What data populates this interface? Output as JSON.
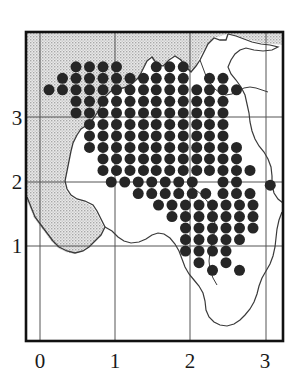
{
  "figure": {
    "type": "distribution-dot-map",
    "title": "",
    "background_color": "#ffffff"
  },
  "axes": {
    "x_ticks": [
      "0",
      "1",
      "2",
      "3"
    ],
    "y_ticks": [
      "1",
      "2",
      "3"
    ],
    "x_range": [
      -0.19,
      3.17
    ],
    "y_range": [
      0.52,
      4.29
    ],
    "grid": "on",
    "grid_color": "#555555",
    "frame_color": "#1a1a1a",
    "xlabel": "",
    "ylabel": ""
  },
  "legend": {
    "entries": [
      {
        "symbol": "filled-circle",
        "label": "",
        "color": "#262626"
      },
      {
        "symbol": "stipple-fill",
        "label": "",
        "color": "#c8c8c8"
      }
    ],
    "position": "none"
  },
  "chart_data": {
    "type": "scatter",
    "title": "",
    "xlabel": "",
    "ylabel": "",
    "xlim": [
      -0.19,
      3.17
    ],
    "ylim": [
      0.52,
      4.29
    ],
    "grid": true,
    "legend_position": "none",
    "marker": "filled-circle",
    "marker_color": "#262626",
    "marker_size_px": 11,
    "grid_spacing": 0.175,
    "x_tick_values": [
      0,
      1,
      2,
      3
    ],
    "y_tick_values": [
      1,
      2,
      3
    ],
    "points": [
      [
        0.48,
        3.8
      ],
      [
        0.66,
        3.8
      ],
      [
        0.84,
        3.8
      ],
      [
        1.02,
        3.8
      ],
      [
        1.55,
        3.8
      ],
      [
        1.73,
        3.8
      ],
      [
        1.91,
        3.8
      ],
      [
        0.3,
        3.62
      ],
      [
        0.48,
        3.62
      ],
      [
        0.66,
        3.62
      ],
      [
        0.84,
        3.62
      ],
      [
        1.02,
        3.62
      ],
      [
        1.2,
        3.62
      ],
      [
        1.38,
        3.62
      ],
      [
        1.55,
        3.62
      ],
      [
        1.73,
        3.62
      ],
      [
        1.91,
        3.62
      ],
      [
        2.26,
        3.62
      ],
      [
        2.44,
        3.62
      ],
      [
        0.12,
        3.44
      ],
      [
        0.3,
        3.44
      ],
      [
        0.48,
        3.44
      ],
      [
        0.66,
        3.44
      ],
      [
        0.84,
        3.44
      ],
      [
        1.02,
        3.44
      ],
      [
        1.2,
        3.44
      ],
      [
        1.38,
        3.44
      ],
      [
        1.55,
        3.44
      ],
      [
        1.73,
        3.44
      ],
      [
        1.91,
        3.44
      ],
      [
        2.09,
        3.44
      ],
      [
        2.26,
        3.44
      ],
      [
        2.44,
        3.44
      ],
      [
        2.62,
        3.44
      ],
      [
        0.48,
        3.26
      ],
      [
        0.66,
        3.26
      ],
      [
        0.84,
        3.26
      ],
      [
        1.02,
        3.26
      ],
      [
        1.2,
        3.26
      ],
      [
        1.38,
        3.26
      ],
      [
        1.55,
        3.26
      ],
      [
        1.73,
        3.26
      ],
      [
        1.91,
        3.26
      ],
      [
        2.09,
        3.26
      ],
      [
        2.26,
        3.26
      ],
      [
        2.44,
        3.26
      ],
      [
        0.48,
        3.08
      ],
      [
        0.66,
        3.08
      ],
      [
        0.84,
        3.08
      ],
      [
        1.02,
        3.08
      ],
      [
        1.2,
        3.08
      ],
      [
        1.38,
        3.08
      ],
      [
        1.55,
        3.08
      ],
      [
        1.73,
        3.08
      ],
      [
        1.91,
        3.08
      ],
      [
        2.09,
        3.08
      ],
      [
        2.26,
        3.08
      ],
      [
        2.44,
        3.08
      ],
      [
        0.66,
        2.9
      ],
      [
        0.84,
        2.9
      ],
      [
        1.02,
        2.9
      ],
      [
        1.2,
        2.9
      ],
      [
        1.38,
        2.9
      ],
      [
        1.55,
        2.9
      ],
      [
        1.73,
        2.9
      ],
      [
        1.91,
        2.9
      ],
      [
        2.09,
        2.9
      ],
      [
        2.26,
        2.9
      ],
      [
        2.44,
        2.9
      ],
      [
        0.66,
        2.72
      ],
      [
        0.84,
        2.72
      ],
      [
        1.02,
        2.72
      ],
      [
        1.2,
        2.72
      ],
      [
        1.38,
        2.72
      ],
      [
        1.55,
        2.72
      ],
      [
        1.73,
        2.72
      ],
      [
        1.91,
        2.72
      ],
      [
        2.09,
        2.72
      ],
      [
        2.26,
        2.72
      ],
      [
        2.44,
        2.72
      ],
      [
        0.66,
        2.54
      ],
      [
        0.84,
        2.54
      ],
      [
        1.02,
        2.54
      ],
      [
        1.2,
        2.54
      ],
      [
        1.38,
        2.54
      ],
      [
        1.55,
        2.54
      ],
      [
        1.73,
        2.54
      ],
      [
        1.91,
        2.54
      ],
      [
        2.09,
        2.54
      ],
      [
        2.26,
        2.54
      ],
      [
        2.44,
        2.54
      ],
      [
        2.62,
        2.54
      ],
      [
        0.84,
        2.36
      ],
      [
        1.02,
        2.36
      ],
      [
        1.2,
        2.36
      ],
      [
        1.38,
        2.36
      ],
      [
        1.55,
        2.36
      ],
      [
        1.73,
        2.36
      ],
      [
        1.91,
        2.36
      ],
      [
        2.09,
        2.36
      ],
      [
        2.26,
        2.36
      ],
      [
        2.44,
        2.36
      ],
      [
        2.62,
        2.36
      ],
      [
        0.84,
        2.18
      ],
      [
        1.02,
        2.18
      ],
      [
        1.2,
        2.18
      ],
      [
        1.38,
        2.18
      ],
      [
        1.55,
        2.18
      ],
      [
        1.73,
        2.18
      ],
      [
        1.91,
        2.18
      ],
      [
        2.09,
        2.18
      ],
      [
        2.26,
        2.18
      ],
      [
        2.44,
        2.18
      ],
      [
        2.62,
        2.18
      ],
      [
        2.8,
        2.18
      ],
      [
        0.95,
        2.0
      ],
      [
        1.13,
        2.0
      ],
      [
        1.31,
        2.0
      ],
      [
        1.49,
        2.0
      ],
      [
        1.67,
        2.0
      ],
      [
        1.85,
        2.0
      ],
      [
        2.03,
        2.0
      ],
      [
        2.44,
        2.0
      ],
      [
        2.62,
        2.0
      ],
      [
        3.07,
        1.95
      ],
      [
        1.31,
        1.82
      ],
      [
        1.49,
        1.82
      ],
      [
        1.67,
        1.82
      ],
      [
        1.85,
        1.82
      ],
      [
        2.03,
        1.82
      ],
      [
        2.21,
        1.82
      ],
      [
        2.44,
        1.82
      ],
      [
        2.62,
        1.82
      ],
      [
        2.8,
        1.82
      ],
      [
        1.58,
        1.64
      ],
      [
        1.76,
        1.64
      ],
      [
        1.94,
        1.64
      ],
      [
        2.12,
        1.64
      ],
      [
        2.3,
        1.64
      ],
      [
        2.48,
        1.64
      ],
      [
        2.66,
        1.64
      ],
      [
        2.84,
        1.64
      ],
      [
        1.76,
        1.46
      ],
      [
        1.94,
        1.46
      ],
      [
        2.12,
        1.46
      ],
      [
        2.3,
        1.46
      ],
      [
        2.48,
        1.46
      ],
      [
        2.66,
        1.46
      ],
      [
        2.84,
        1.46
      ],
      [
        1.94,
        1.28
      ],
      [
        2.12,
        1.28
      ],
      [
        2.3,
        1.28
      ],
      [
        2.48,
        1.28
      ],
      [
        2.66,
        1.28
      ],
      [
        2.84,
        1.28
      ],
      [
        1.94,
        1.1
      ],
      [
        2.12,
        1.1
      ],
      [
        2.3,
        1.1
      ],
      [
        2.48,
        1.1
      ],
      [
        2.66,
        1.1
      ],
      [
        1.94,
        0.92
      ],
      [
        2.12,
        0.92
      ],
      [
        2.3,
        0.92
      ],
      [
        2.48,
        0.92
      ],
      [
        2.12,
        0.74
      ],
      [
        2.48,
        0.74
      ],
      [
        2.3,
        0.62
      ],
      [
        2.66,
        0.62
      ]
    ]
  },
  "icons": {
    "dot": "filled-circle-icon",
    "sea": "stipple-region-icon",
    "coast": "coastline-path-icon"
  }
}
